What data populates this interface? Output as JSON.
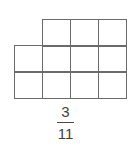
{
  "figure": {
    "name": "fraction-area-model",
    "background_color": "#ffffff",
    "line_color": "#6b6b6b",
    "text_color": "#3f3f3f",
    "grid": {
      "total_cells": 11,
      "shaded_cells": 0,
      "cell_width_px": 29,
      "cell_height_px": 28,
      "rows": [
        {
          "id": "row-top",
          "cells": 3,
          "offset_cells": 1,
          "cell_labels": [
            "",
            "",
            ""
          ]
        },
        {
          "id": "row-middle",
          "cells": 4,
          "offset_cells": 0,
          "cell_labels": [
            "",
            "",
            "",
            ""
          ]
        },
        {
          "id": "row-bottom",
          "cells": 4,
          "offset_cells": 0,
          "cell_labels": [
            "",
            "",
            "",
            ""
          ]
        }
      ]
    },
    "fraction": {
      "numerator": "3",
      "denominator": "11",
      "bar": "—",
      "plain_text": "3/11"
    }
  }
}
